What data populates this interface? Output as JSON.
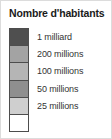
{
  "legend": {
    "title": "Nombre d'habitants",
    "background_color": "#ffffff",
    "border_color": "#dcdcdc",
    "swatch_outline_color": "#4d4d4d",
    "title_color": "#1a1a1a",
    "label_color": "#333333",
    "bands": [
      {
        "name": "band-1-milliard",
        "color": "#4f4f4f"
      },
      {
        "name": "band-200-millions",
        "color": "#a3a3a3"
      },
      {
        "name": "band-100-millions",
        "color": "#b5b5b5"
      },
      {
        "name": "band-50-millions",
        "color": "#8f8f8f"
      },
      {
        "name": "band-25-millions",
        "color": "#cfcfcf"
      },
      {
        "name": "band-lowest",
        "color": "#ffffff"
      }
    ],
    "labels": [
      "1 milliard",
      "200 millions",
      "100 millions",
      "50 millions",
      "25 millions"
    ]
  },
  "chart_data": {
    "type": "table",
    "title": "Nombre d'habitants",
    "xlabel": "",
    "ylabel": "",
    "categories": [
      "1 milliard",
      "200 millions",
      "100 millions",
      "50 millions",
      "25 millions"
    ],
    "values": [
      1000000000,
      200000000,
      100000000,
      50000000,
      25000000
    ],
    "legend_position": "standalone",
    "grid": false,
    "series": [
      {
        "name": "Nombre d'habitants",
        "values": [
          1000000000,
          200000000,
          100000000,
          50000000,
          25000000
        ],
        "colors": [
          "#4f4f4f",
          "#a3a3a3",
          "#b5b5b5",
          "#8f8f8f",
          "#cfcfcf"
        ]
      }
    ],
    "annotations": []
  }
}
